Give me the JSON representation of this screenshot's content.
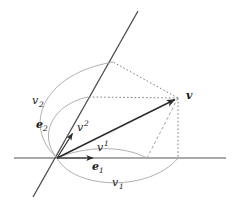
{
  "figure": {
    "background_color": "#ffffff",
    "axis_color": "#808080",
    "line_color": "#3c3c3c",
    "arc_color": "#9a9a9a",
    "dash_color": "#646464",
    "label_color": "#1a1a1a",
    "width": 233,
    "height": 204
  },
  "labels": {
    "vector": {
      "text": "v",
      "x": 186,
      "y": 99
    },
    "v_upper2": {
      "base": "v",
      "sup": "2",
      "x": 77,
      "y": 131
    },
    "v_upper1": {
      "base": "v",
      "sup": "1",
      "x": 97,
      "y": 151
    },
    "v_lower2": {
      "base": "v",
      "sub": "2",
      "x": 32,
      "y": 104
    },
    "v_lower1": {
      "base": "v",
      "sub": "1",
      "x": 112,
      "y": 186
    },
    "e2": {
      "base": "e",
      "sub": "2",
      "x": 36,
      "y": 128
    },
    "e1": {
      "base": "e",
      "sub": "1",
      "x": 92,
      "y": 170
    }
  },
  "geometry": {
    "origin": {
      "x": 57,
      "y": 158
    },
    "vector_tip": {
      "x": 178,
      "y": 98
    },
    "x_axis": {
      "x1": 14,
      "y1": 158,
      "x2": 226,
      "y2": 158
    },
    "e2_axis": {
      "x1": 138,
      "y1": 11,
      "x2": 33,
      "y2": 197
    },
    "e1_unit_tip": {
      "x": 95,
      "y": 158
    },
    "e2_unit_tip": {
      "x": 74,
      "y": 131
    },
    "contravariant_x": {
      "x": 147,
      "y": 158
    },
    "contravariant_y": {
      "x": 88,
      "y": 97
    },
    "covariant_x": {
      "x": 178,
      "y": 158
    },
    "covariant_y": {
      "x": 113,
      "y": 62
    }
  }
}
